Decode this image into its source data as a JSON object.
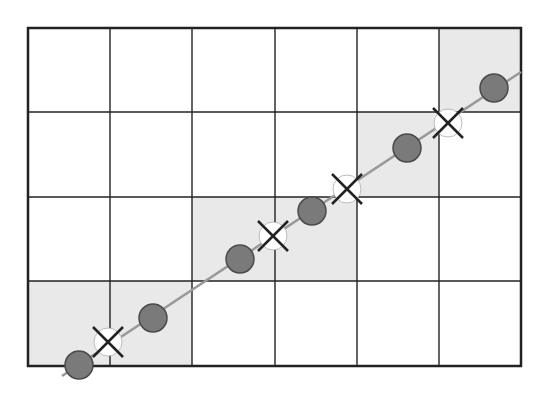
{
  "diagram": {
    "type": "grid-line-traversal",
    "grid": {
      "left": 28,
      "top": 28,
      "right": 521,
      "bottom": 366,
      "columns": 6,
      "rows": 4,
      "col_lines": [
        28,
        110,
        192,
        275,
        357,
        439,
        521
      ],
      "row_lines": [
        28,
        112,
        197,
        281,
        366
      ],
      "line_color": "#222222",
      "border_width": 2.5,
      "inner_width": 1.4
    },
    "shaded_regions": [
      {
        "x": 28,
        "y": 281,
        "w": 164,
        "h": 85
      },
      {
        "x": 192,
        "y": 197,
        "w": 165,
        "h": 84
      },
      {
        "x": 357,
        "y": 112,
        "w": 82,
        "h": 85
      },
      {
        "x": 439,
        "y": 28,
        "w": 82,
        "h": 84
      }
    ],
    "shade_color": "#e9e9e9",
    "line": {
      "x1": 62,
      "y1": 376,
      "x2": 521,
      "y2": 72,
      "color": "#999999",
      "width": 2.5
    },
    "sample_points": [
      {
        "x": 79,
        "y": 365
      },
      {
        "x": 153,
        "y": 318
      },
      {
        "x": 240,
        "y": 259
      },
      {
        "x": 312,
        "y": 211
      },
      {
        "x": 407,
        "y": 148
      },
      {
        "x": 494,
        "y": 88
      }
    ],
    "sample_point_style": {
      "r": 14,
      "fill": "#7a7a7a",
      "stroke": "#4a4a4a"
    },
    "intersection_points": [
      {
        "x": 108,
        "y": 342
      },
      {
        "x": 273,
        "y": 236
      },
      {
        "x": 347,
        "y": 189
      },
      {
        "x": 448,
        "y": 123
      }
    ],
    "intersection_style": {
      "r": 14,
      "fill": "#ffffff",
      "stroke": "#bbbbbb",
      "x_size": 15,
      "x_color": "#222222",
      "x_width": 2.5
    }
  }
}
